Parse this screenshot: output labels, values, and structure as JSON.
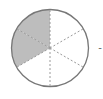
{
  "diagram": {
    "type": "fraction-circle",
    "total_parts": 6,
    "shaded_parts": 2,
    "shaded_color": "#bdbdbd",
    "outline_color": "#777777",
    "divider_color": "#9a9a9a",
    "trailing_mark": "-"
  }
}
